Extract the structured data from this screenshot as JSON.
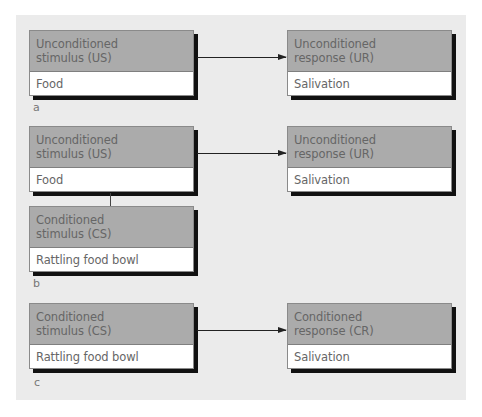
{
  "diagram": {
    "type": "classical-conditioning-flow",
    "colors": {
      "panel_bg": "#ebebeb",
      "box_header_bg": "#ababab",
      "box_body_bg": "#ffffff",
      "text": "#666666",
      "shadow": "#111111",
      "arrow": "#222222"
    },
    "sections": [
      {
        "label": "a",
        "left": {
          "title_line1": "Unconditioned",
          "title_line2": "stimulus (US)",
          "value": "Food"
        },
        "right": {
          "title_line1": "Unconditioned",
          "title_line2": "response (UR)",
          "value": "Salivation"
        }
      },
      {
        "label": "b",
        "left": {
          "title_line1": "Unconditioned",
          "title_line2": "stimulus (US)",
          "value": "Food"
        },
        "paired": {
          "title_line1": "Conditioned",
          "title_line2": "stimulus (CS)",
          "value": "Rattling food bowl"
        },
        "right": {
          "title_line1": "Unconditioned",
          "title_line2": "response (UR)",
          "value": "Salivation"
        }
      },
      {
        "label": "c",
        "left": {
          "title_line1": "Conditioned",
          "title_line2": "stimulus (CS)",
          "value": "Rattling food bowl"
        },
        "right": {
          "title_line1": "Conditioned",
          "title_line2": "response (CR)",
          "value": "Salivation"
        }
      }
    ]
  }
}
